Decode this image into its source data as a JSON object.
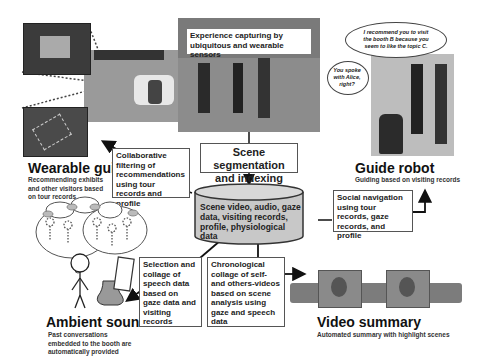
{
  "capture": {
    "label": "Experience capturing by ubiquitous and wearable sensors"
  },
  "segmentation": {
    "label": "Scene segmentation and indexing"
  },
  "database": {
    "label": "Scene video, audio, gaze data, visiting records, profile, physiological data"
  },
  "wearable_guide": {
    "title": "Wearable guide",
    "subtitle": "Recommending exhibits and other visitors based on tour records"
  },
  "guide_robot": {
    "title": "Guide robot",
    "subtitle": "Guiding based on  visiting records",
    "bubble_1": "I recommend you to visit the booth B because you seem to like the topic C.",
    "bubble_2": "You spoke with Alice, right?"
  },
  "ambient_sound": {
    "title": "Ambient sound",
    "subtitle": "Past conversations embedded to the booth are automatically provided"
  },
  "video_summary": {
    "title": "Video summary",
    "subtitle": "Automated summary with highlight scenes"
  },
  "process_boxes": {
    "collaborative": "Collaborative filtering of recommendations using tour records and profile",
    "social_nav": "Social navigation using tour records, gaze records, and profile",
    "selection": "Selection and collage of speech data based on gaze data and visiting records",
    "chronological": "Chronological collage of self- and others-videos based on scene analysis using gaze and speech data"
  },
  "colors": {
    "database_fill": "#c8c8c8",
    "photo_gray": "#6b6b6b",
    "border": "#555555"
  }
}
